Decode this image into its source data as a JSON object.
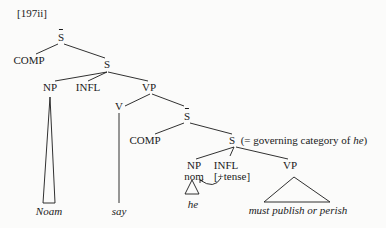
{
  "example_number": "[197ii]",
  "tree": {
    "root": "S",
    "comp1": "COMP",
    "s1": "S",
    "np1": "NP",
    "infl1": "INFL",
    "vp1": "VP",
    "v": "V",
    "sbar2": "S",
    "comp2": "COMP",
    "s2": "S",
    "s2_annotation": "(= governing category of ",
    "s2_annotation_italic": "he",
    "s2_annotation_close": ")",
    "np2": "NP",
    "np2_feature": "nom",
    "infl2": "INFL",
    "infl2_feature": "[+tense]",
    "vp2": "VP"
  },
  "leaves": {
    "noam": "Noam",
    "say": "say",
    "he": "he",
    "vp_phrase": "must publish or perish"
  }
}
